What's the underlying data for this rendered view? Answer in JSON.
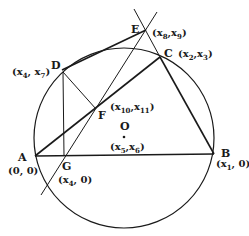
{
  "diagram": {
    "type": "geometry",
    "colors": {
      "stroke": "#1a1a1a",
      "background": "#ffffff"
    },
    "circle": {
      "center_label": "O",
      "center_coord": "(x5,x6)"
    },
    "points": [
      {
        "name": "A",
        "coord": "(0, 0)"
      },
      {
        "name": "B",
        "coord": "(x1, 0)"
      },
      {
        "name": "C",
        "coord": "(x2,x3)"
      },
      {
        "name": "D",
        "coord": "(x4, x7)"
      },
      {
        "name": "E",
        "coord": "(x8,x9)"
      },
      {
        "name": "F",
        "coord": "(x10,x11)"
      },
      {
        "name": "G",
        "coord": "(x4, 0)"
      },
      {
        "name": "O",
        "coord": "(x5,x6)"
      }
    ],
    "labels": {
      "A": "A",
      "B": "B",
      "C": "C",
      "D": "D",
      "E": "E",
      "F": "F",
      "G": "G",
      "O": "O",
      "A_coord": "(0, 0)",
      "B_coord_open": "(x",
      "B_coord_sub": "1",
      "B_coord_close": ", 0)",
      "C_x": "(x",
      "C_x_sub": "2",
      "C_y": ",x",
      "C_y_sub": "3",
      "C_close": ")",
      "D_x": "(x",
      "D_x_sub": "4",
      "D_y": ", x",
      "D_y_sub": "7",
      "D_close": ")",
      "E_x": "(x",
      "E_x_sub": "8",
      "E_y": ",x",
      "E_y_sub": "9",
      "E_close": ")",
      "F_x": "(x",
      "F_x_sub": "10",
      "F_y": ",x",
      "F_y_sub": "11",
      "F_close": ")",
      "G_x": "(x",
      "G_x_sub": "4",
      "G_close": ", 0)",
      "O_x": "(x",
      "O_x_sub": "5",
      "O_y": ",x",
      "O_y_sub": "6",
      "O_close": ")"
    },
    "segments": [
      "AB",
      "BC",
      "AC",
      "DE",
      "DG",
      "DF",
      "EB (extended)",
      "EG (extended)"
    ]
  }
}
